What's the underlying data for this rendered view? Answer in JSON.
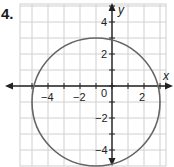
{
  "problem_number": "4.",
  "chart_data": {
    "type": "line",
    "title": "",
    "xlabel": "x",
    "ylabel": "y",
    "xlim": [
      -5.5,
      3.5
    ],
    "ylim": [
      -5,
      5
    ],
    "grid": true,
    "x_tick_labels": [
      "-4",
      "-2",
      "0",
      "2"
    ],
    "y_tick_labels": [
      "4",
      "2",
      "-2",
      "-4"
    ],
    "shapes": [
      {
        "type": "circle",
        "center": [
          -1,
          -1
        ],
        "radius": 4,
        "color": "#555555"
      }
    ]
  }
}
